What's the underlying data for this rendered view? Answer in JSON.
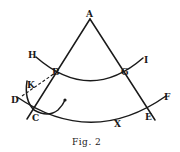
{
  "figure": {
    "caption": "Fig. 2",
    "labels": {
      "A": "A",
      "B": "B",
      "C": "C",
      "D": "D",
      "E": "E",
      "F": "F",
      "G": "G",
      "H": "H",
      "I": "I",
      "K": "K",
      "X": "X"
    },
    "colors": {
      "ink": "#1a1a1a",
      "background": "#ffffff"
    }
  }
}
